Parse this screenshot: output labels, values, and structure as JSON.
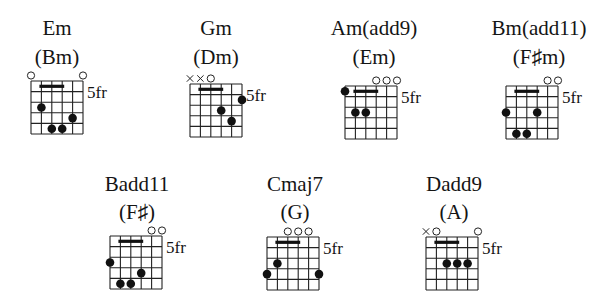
{
  "fret_label": "5fr",
  "chords": [
    {
      "name": "Em",
      "alt": "(Bm)",
      "markers": [
        "o",
        "",
        "",
        "",
        "",
        "o"
      ],
      "dots": [
        [
          2,
          3
        ],
        [
          3,
          5
        ],
        [
          4,
          5
        ],
        [
          5,
          4
        ]
      ],
      "bar": [
        2,
        4,
        1
      ]
    },
    {
      "name": "Gm",
      "alt": "(Dm)",
      "markers": [
        "x",
        "x",
        "o",
        "",
        "",
        ""
      ],
      "dots": [
        [
          6,
          2
        ],
        [
          4,
          3
        ],
        [
          5,
          4
        ]
      ],
      "bar": [
        2,
        4,
        1
      ]
    },
    {
      "name": "Am(add9)",
      "alt": "(Em)",
      "markers": [
        "",
        "",
        "",
        "o",
        "o",
        "o"
      ],
      "dots": [
        [
          1,
          1
        ],
        [
          2,
          3
        ],
        [
          3,
          3
        ]
      ],
      "bar": [
        2,
        4,
        1
      ]
    },
    {
      "name": "Bm(add11)",
      "alt": "(F♯m)",
      "markers": [
        "",
        "",
        "",
        "",
        "o",
        "o"
      ],
      "dots": [
        [
          1,
          3
        ],
        [
          4,
          3
        ],
        [
          2,
          5
        ],
        [
          3,
          5
        ]
      ],
      "bar": [
        2,
        4,
        1
      ]
    },
    {
      "name": "Badd11",
      "alt": "(F♯)",
      "markers": [
        "",
        "",
        "",
        "",
        "o",
        "o"
      ],
      "dots": [
        [
          1,
          3
        ],
        [
          4,
          4
        ],
        [
          2,
          5
        ],
        [
          3,
          5
        ]
      ],
      "bar": [
        2,
        4,
        1
      ]
    },
    {
      "name": "Cmaj7",
      "alt": "(G)",
      "markers": [
        "",
        "",
        "o",
        "o",
        "o",
        ""
      ],
      "dots": [
        [
          2,
          3
        ],
        [
          1,
          4
        ],
        [
          6,
          4
        ]
      ],
      "bar": [
        2,
        4,
        1
      ]
    },
    {
      "name": "Dadd9",
      "alt": "(A)",
      "markers": [
        "x",
        "o",
        "",
        "",
        "",
        "o"
      ],
      "dots": [
        [
          3,
          3
        ],
        [
          4,
          3
        ],
        [
          5,
          3
        ]
      ],
      "bar": [
        2,
        4,
        1
      ]
    }
  ]
}
